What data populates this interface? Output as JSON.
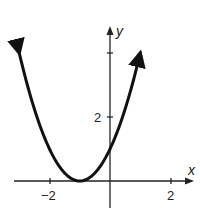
{
  "chart_data": {
    "type": "line",
    "title": "",
    "xlabel": "x",
    "ylabel": "y",
    "function": "y = (x + 1)^2",
    "xlim": [
      -3.5,
      2.5
    ],
    "ylim": [
      -0.8,
      4.6
    ],
    "x_ticks": [
      -2,
      2
    ],
    "x_tick_labels": [
      "-2",
      "2"
    ],
    "y_ticks": [
      2,
      4
    ],
    "y_tick_labels": [
      "2",
      ""
    ],
    "grid": false,
    "series": [
      {
        "name": "parabola",
        "x": [
          -3,
          -2.5,
          -2,
          -1.5,
          -1,
          -0.5,
          0,
          0.5,
          1
        ],
        "values": [
          4,
          2.25,
          1,
          0.25,
          0,
          0.25,
          1,
          2.25,
          4
        ]
      }
    ],
    "vertex": [
      -1,
      0
    ],
    "y_intercept": 1
  },
  "labels": {
    "x_axis": "x",
    "y_axis": "y",
    "tick_neg2": "−2",
    "tick_2x": "2",
    "tick_2y": "2"
  }
}
